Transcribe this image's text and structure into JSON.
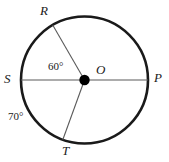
{
  "figure": {
    "type": "circle-with-radii",
    "colors": {
      "circle_stroke": "#1a1a1a",
      "radius_stroke": "#5a5a5a",
      "diameter_stroke": "#5a5a5a",
      "center_dot": "#000000",
      "background": "#ffffff",
      "label_color": "#1a1a1a"
    },
    "circle": {
      "center_x": 84.5,
      "center_y": 80,
      "radius": 63.5,
      "stroke_width": 2.6
    },
    "center_point": {
      "label": "O",
      "x": 84.5,
      "y": 80,
      "dot_radius": 5.2
    },
    "points": [
      {
        "label": "R",
        "angle_deg": 120,
        "x": 52.7,
        "y": 25.0
      },
      {
        "label": "S",
        "angle_deg": 180,
        "x": 21.0,
        "y": 80.0
      },
      {
        "label": "P",
        "angle_deg": 0,
        "x": 148.0,
        "y": 80.0
      },
      {
        "label": "T",
        "angle_deg": 250,
        "x": 62.8,
        "y": 139.7
      }
    ],
    "segments": [
      {
        "name": "diameter-SP",
        "from": "S",
        "to": "P",
        "stroke_width": 1.1
      },
      {
        "name": "radius-OR",
        "from": "O",
        "to": "R",
        "stroke_width": 1.1
      },
      {
        "name": "radius-OT",
        "from": "O",
        "to": "T",
        "stroke_width": 1.1
      }
    ],
    "angles": [
      {
        "name": "angle-ROS",
        "value": "60°",
        "between": [
          "OR",
          "OS"
        ],
        "label_x": 48,
        "label_y": 61
      },
      {
        "name": "angle-SOT",
        "value": "70°",
        "between": [
          "OS",
          "OT"
        ],
        "label_x": 8,
        "label_y": 111
      }
    ],
    "labels": {
      "R": "R",
      "S": "S",
      "O": "O",
      "P": "P",
      "T": "T",
      "angle_ros": "60°",
      "angle_sot": "70°"
    }
  }
}
